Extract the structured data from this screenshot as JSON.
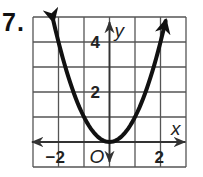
{
  "problem": {
    "number": "7."
  },
  "chart_data": {
    "type": "line",
    "title": "",
    "function": "y = x^2",
    "xlabel": "x",
    "ylabel": "y",
    "xlim": [
      -3,
      3
    ],
    "ylim": [
      -1,
      5
    ],
    "grid": true,
    "grid_step": 1,
    "x_tick_labels": [
      {
        "value": -2,
        "label": "−2"
      },
      {
        "value": 2,
        "label": "2"
      }
    ],
    "y_tick_labels": [
      {
        "value": 2,
        "label": "2"
      },
      {
        "value": 4,
        "label": "4"
      }
    ],
    "origin_label": "O",
    "series": [
      {
        "name": "parabola",
        "x": [
          -2.2,
          -2,
          -1.5,
          -1,
          -0.5,
          0,
          0.5,
          1,
          1.5,
          2,
          2.2
        ],
        "y": [
          4.84,
          4,
          2.25,
          1,
          0.25,
          0,
          0.25,
          1,
          2.25,
          4,
          4.84
        ],
        "arrows_at_ends": true
      }
    ],
    "colors": {
      "curve": "#111111",
      "grid": "#555555",
      "axis": "#333333"
    }
  }
}
